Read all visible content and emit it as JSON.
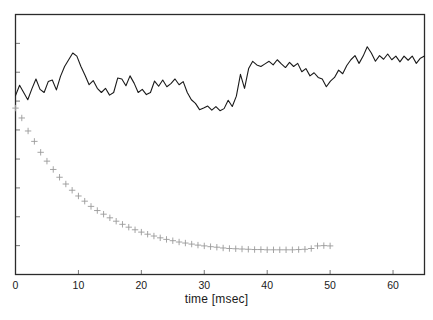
{
  "chart_data": {
    "type": "line",
    "title": "",
    "xlabel": "time [msec]",
    "ylabel": "",
    "xlim": [
      0,
      65
    ],
    "ylim": [
      0,
      1
    ],
    "grid": false,
    "legend": null,
    "xticks": [
      0,
      10,
      20,
      30,
      40,
      50,
      60
    ],
    "xticklabels": [
      "0",
      "10",
      "20",
      "30",
      "40",
      "50",
      "60"
    ],
    "yticks": [
      0.0,
      0.111,
      0.222,
      0.333,
      0.444,
      0.556,
      0.667,
      0.778,
      0.889,
      1.0
    ],
    "yticklabels": [
      "",
      "",
      "",
      "",
      "",
      "",
      "",
      "",
      "",
      ""
    ],
    "series": [
      {
        "name": "noisy-signal",
        "type": "line",
        "color": "#1a1a1a",
        "marker": "none",
        "linewidth": 1.1,
        "x": [
          0.0,
          0.65,
          1.3,
          1.95,
          2.6,
          3.25,
          3.9,
          4.55,
          5.2,
          5.85,
          6.5,
          7.15,
          7.8,
          8.45,
          9.1,
          9.75,
          10.4,
          11.05,
          11.7,
          12.35,
          13.0,
          13.65,
          14.3,
          14.95,
          15.6,
          16.25,
          16.9,
          17.55,
          18.2,
          18.85,
          19.5,
          20.15,
          20.8,
          21.45,
          22.1,
          22.75,
          23.4,
          24.05,
          24.7,
          25.35,
          26.0,
          26.65,
          27.3,
          27.95,
          28.6,
          29.25,
          29.9,
          30.55,
          31.2,
          31.85,
          32.5,
          33.15,
          33.8,
          34.45,
          35.1,
          35.75,
          36.4,
          37.05,
          37.7,
          38.35,
          39.0,
          39.65,
          40.3,
          40.95,
          41.6,
          42.25,
          42.9,
          43.55,
          44.2,
          44.85,
          45.5,
          46.15,
          46.8,
          47.45,
          48.1,
          48.75,
          49.4,
          50.05,
          50.7,
          51.35,
          52.0,
          52.65,
          53.3,
          53.95,
          54.6,
          55.25,
          55.9,
          56.55,
          57.2,
          57.85,
          58.5,
          59.15,
          59.8,
          60.45,
          61.1,
          61.75,
          62.4,
          63.05,
          63.7,
          64.35,
          65.0
        ],
        "y": [
          0.688,
          0.728,
          0.7,
          0.672,
          0.714,
          0.752,
          0.712,
          0.7,
          0.742,
          0.748,
          0.71,
          0.762,
          0.8,
          0.826,
          0.852,
          0.84,
          0.8,
          0.766,
          0.73,
          0.746,
          0.716,
          0.7,
          0.716,
          0.69,
          0.7,
          0.756,
          0.752,
          0.726,
          0.764,
          0.736,
          0.7,
          0.712,
          0.692,
          0.7,
          0.744,
          0.724,
          0.748,
          0.722,
          0.734,
          0.752,
          0.73,
          0.742,
          0.7,
          0.672,
          0.658,
          0.634,
          0.64,
          0.648,
          0.632,
          0.646,
          0.63,
          0.638,
          0.67,
          0.646,
          0.686,
          0.77,
          0.716,
          0.792,
          0.82,
          0.806,
          0.8,
          0.81,
          0.82,
          0.806,
          0.826,
          0.81,
          0.796,
          0.816,
          0.8,
          0.812,
          0.78,
          0.792,
          0.764,
          0.776,
          0.758,
          0.752,
          0.722,
          0.744,
          0.758,
          0.786,
          0.772,
          0.804,
          0.826,
          0.842,
          0.812,
          0.84,
          0.876,
          0.852,
          0.82,
          0.842,
          0.828,
          0.848,
          0.826,
          0.84,
          0.818,
          0.84,
          0.824,
          0.84,
          0.812,
          0.832,
          0.84
        ]
      },
      {
        "name": "decay-markers",
        "type": "scatter",
        "color": "#9a9a9a",
        "marker": "plus",
        "markersize": 3.2,
        "x": [
          0.0,
          1.0,
          2.0,
          3.0,
          4.0,
          5.0,
          6.0,
          7.0,
          8.0,
          9.0,
          10.0,
          11.0,
          12.0,
          13.0,
          14.0,
          15.0,
          16.0,
          17.0,
          18.0,
          19.0,
          20.0,
          21.0,
          22.0,
          23.0,
          24.0,
          25.0,
          26.0,
          27.0,
          28.0,
          29.0,
          30.0,
          31.0,
          32.0,
          33.0,
          34.0,
          35.0,
          36.0,
          37.0,
          38.0,
          39.0,
          40.0,
          41.0,
          42.0,
          43.0,
          44.0,
          45.0,
          46.0,
          47.0,
          48.0,
          49.0,
          50.0
        ],
        "y": [
          0.64,
          0.602,
          0.552,
          0.512,
          0.47,
          0.436,
          0.404,
          0.374,
          0.348,
          0.324,
          0.302,
          0.282,
          0.262,
          0.246,
          0.232,
          0.218,
          0.205,
          0.193,
          0.182,
          0.172,
          0.163,
          0.155,
          0.148,
          0.141,
          0.135,
          0.13,
          0.125,
          0.121,
          0.117,
          0.113,
          0.11,
          0.107,
          0.105,
          0.102,
          0.1,
          0.099,
          0.098,
          0.097,
          0.096,
          0.096,
          0.095,
          0.095,
          0.095,
          0.095,
          0.095,
          0.096,
          0.097,
          0.1,
          0.11,
          0.111,
          0.11
        ]
      }
    ]
  },
  "axes": {
    "frame_color": "#2b2b2b",
    "background": "#ffffff"
  }
}
